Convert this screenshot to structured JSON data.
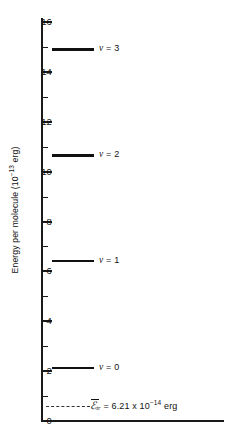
{
  "chart_data": {
    "type": "scatter",
    "title": "",
    "xlabel": "",
    "ylabel": "Energy per molecule (10⁻¹³ erg)",
    "ylabel_text": "Energy per molecule (10",
    "ylabel_exponent": "−13",
    "ylabel_suffix": " erg)",
    "ylim": [
      0,
      16
    ],
    "y_ticks": [
      0,
      2,
      4,
      6,
      8,
      10,
      12,
      14,
      16
    ],
    "y_tick_labels": [
      "0",
      "2",
      "4",
      "6",
      "8",
      "10",
      "12",
      "14",
      "16"
    ],
    "y_minor_ticks": [
      1,
      3,
      5,
      7,
      9,
      11,
      13,
      15
    ],
    "grid": false,
    "legend": "none",
    "levels": [
      {
        "label_v": "v",
        "label_eq": " = 0",
        "quantum_number": 0,
        "value": 2.13
      },
      {
        "label_v": "v",
        "label_eq": " = 1",
        "quantum_number": 1,
        "value": 6.42
      },
      {
        "label_v": "v",
        "label_eq": " = 2",
        "quantum_number": 2,
        "value": 10.65
      },
      {
        "label_v": "v",
        "label_eq": " = 3",
        "quantum_number": 3,
        "value": 14.9
      }
    ],
    "reference_line": {
      "symbol": "ℰ",
      "subscript": "tr",
      "equals": " = 6.21 x 10",
      "exponent": "−14",
      "units": " erg",
      "value": 0.621,
      "style": "dashed"
    },
    "axis_color": "#1a1a1a",
    "level_color": "#111111",
    "dash_color": "#333333",
    "background": "#ffffff"
  }
}
